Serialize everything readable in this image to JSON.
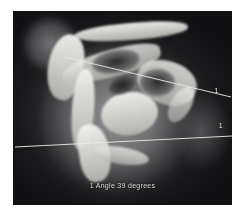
{
  "viewer": {
    "name": "medical-image-viewer",
    "background_color": "#ffffff"
  },
  "scan": {
    "modality_appearance": "grayscale-ct-xray",
    "anatomy": "hip-pelvis",
    "frame_color": "#111113",
    "alt": "Grayscale CT slice of hip joint with angle measurement overlay"
  },
  "overlay": {
    "line_color": "#e8e8e4",
    "text_color": "#dcdcd8",
    "lines": [
      {
        "id": "line-1",
        "label": "1",
        "x1": 52,
        "y1": 46,
        "x2": 218,
        "y2": 86
      },
      {
        "id": "line-2",
        "label": "1",
        "x1": 2,
        "y1": 136,
        "x2": 219,
        "y2": 125
      }
    ],
    "labels": {
      "line_1_label": "1",
      "line_2_label": "1"
    },
    "caption": "1 Angle  39 degrees",
    "measurement": {
      "index": "1",
      "type": "Angle",
      "value": "39",
      "unit": "degrees"
    }
  }
}
